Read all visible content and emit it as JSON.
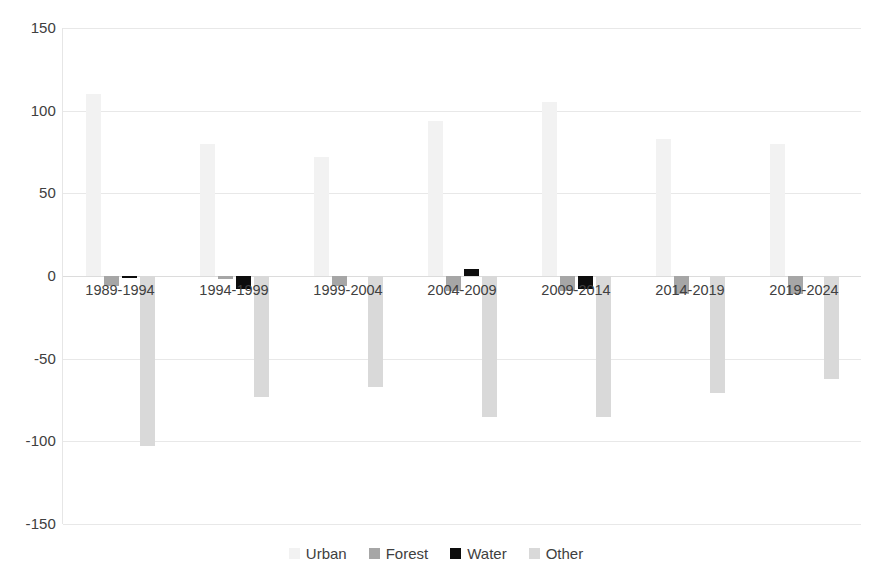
{
  "chart_data": {
    "type": "bar",
    "title": "",
    "subtitle": "",
    "xlabel": "",
    "ylabel": "",
    "categories": [
      "1989-1994",
      "1994-1999",
      "1999-2004",
      "2004-2009",
      "2009-2014",
      "2014-2019",
      "2019-2024"
    ],
    "series": [
      {
        "name": "Urban",
        "color": "#F2F2F2",
        "values": [
          110,
          80,
          72,
          94,
          105,
          83,
          80
        ]
      },
      {
        "name": "Forest",
        "color": "#A6A6A6",
        "values": [
          -6,
          -2,
          -6,
          -9,
          -9,
          -11,
          -11
        ]
      },
      {
        "name": "Water",
        "color": "#0D0D0D",
        "values": [
          -1,
          -8,
          0,
          4,
          -8,
          0,
          0
        ]
      },
      {
        "name": "Other",
        "color": "#D9D9D9",
        "values": [
          -103,
          -73,
          -67,
          -85,
          -85,
          -71,
          -62
        ]
      }
    ],
    "ylim": [
      -150,
      150
    ],
    "y_ticks": [
      150,
      100,
      50,
      0,
      -50,
      -100,
      -150
    ],
    "y_tick_labels": [
      "150",
      "100",
      "50",
      "0",
      "-50",
      "-100",
      "-150"
    ],
    "grid": true,
    "grid_axis": "y",
    "legend_position": "bottom",
    "legend_entries": [
      "Urban",
      "Forest",
      "Water",
      "Other"
    ],
    "annotations": []
  },
  "legend": {
    "items": [
      {
        "label": "Urban",
        "swatch": "legend-swatch-urban",
        "color": "#F2F2F2"
      },
      {
        "label": "Forest",
        "swatch": "legend-swatch-forest",
        "color": "#A6A6A6"
      },
      {
        "label": "Water",
        "swatch": "legend-swatch-water",
        "color": "#0D0D0D"
      },
      {
        "label": "Other",
        "swatch": "legend-swatch-other",
        "color": "#D9D9D9"
      }
    ]
  }
}
